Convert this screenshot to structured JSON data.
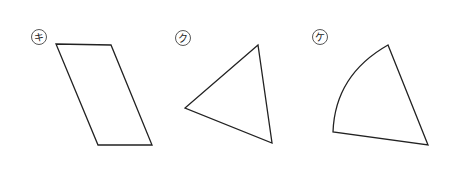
{
  "figures": [
    {
      "id": "ki",
      "label": "キ",
      "shape": "parallelogram"
    },
    {
      "id": "ku",
      "label": "ク",
      "shape": "triangle"
    },
    {
      "id": "ke",
      "label": "ケ",
      "shape": "sector"
    }
  ],
  "colors": {
    "stroke": "#222222",
    "background": "#ffffff"
  }
}
